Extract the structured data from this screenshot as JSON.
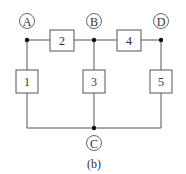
{
  "diagram": {
    "nodes": [
      {
        "id": "A",
        "label": "A"
      },
      {
        "id": "B",
        "label": "B"
      },
      {
        "id": "D",
        "label": "D"
      },
      {
        "id": "C",
        "label": "C"
      }
    ],
    "elements": [
      {
        "id": "1",
        "label": "1",
        "from": "A",
        "to": "C"
      },
      {
        "id": "2",
        "label": "2",
        "from": "A",
        "to": "B"
      },
      {
        "id": "3",
        "label": "3",
        "from": "B",
        "to": "C"
      },
      {
        "id": "4",
        "label": "4",
        "from": "B",
        "to": "D"
      },
      {
        "id": "5",
        "label": "5",
        "from": "D",
        "to": "C"
      }
    ],
    "caption": "(b)"
  }
}
